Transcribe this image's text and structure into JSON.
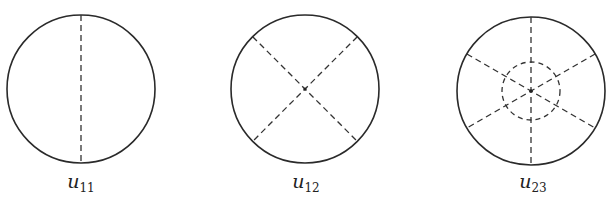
{
  "figure": {
    "panels": [
      {
        "id": "u11",
        "symbol": "u",
        "subscript": "11",
        "cx": 81,
        "cy": 89,
        "r": 74,
        "diameters_deg": [
          90
        ],
        "inner_circles": []
      },
      {
        "id": "u12",
        "symbol": "u",
        "subscript": "12",
        "cx": 305,
        "cy": 89,
        "r": 74,
        "diameters_deg": [
          45,
          135
        ],
        "inner_circles": []
      },
      {
        "id": "u23",
        "symbol": "u",
        "subscript": "23",
        "cx": 531,
        "cy": 91,
        "r": 74,
        "diameters_deg": [
          90,
          30,
          150
        ],
        "inner_circles": [
          29
        ]
      }
    ],
    "colors": {
      "line": "#2a2a2a",
      "background": "#ffffff"
    }
  }
}
